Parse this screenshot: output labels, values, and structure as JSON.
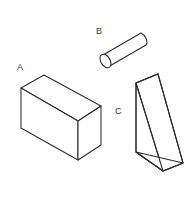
{
  "figure": {
    "background_color": "#ffffff",
    "line_color": "#2b2b2b",
    "face_color": "#ffffff",
    "label_color": "#3a3a3a",
    "width": 195,
    "height": 211
  },
  "shapes": [
    {
      "id": "shape-a",
      "label": "A",
      "name": "rectangular-box",
      "description": "Rectangular cuboid drawn in oblique projection, long horizontal face",
      "label_x": 17,
      "label_y": 70
    },
    {
      "id": "shape-b",
      "label": "B",
      "name": "cylinder",
      "description": "Cylinder tilted up to the right with visible elliptical end cap",
      "label_x": 96,
      "label_y": 34
    },
    {
      "id": "shape-c",
      "label": "C",
      "name": "triangular-prism",
      "description": "Triangular prism standing on its base, hypotenuse sloping down to the right",
      "label_x": 115,
      "label_y": 114
    }
  ]
}
